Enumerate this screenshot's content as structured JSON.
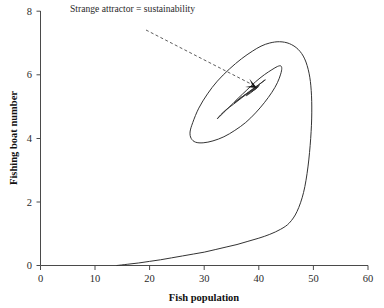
{
  "figure": {
    "background_color": "#ffffff",
    "line_color": "#333333",
    "axis_color": "#4a4a4a"
  },
  "annotation": {
    "text": "Strange attractor = sustainability",
    "leader_start": [
      146,
      30
    ],
    "leader_end": [
      255,
      86
    ],
    "arrow_target": [
      257,
      88
    ]
  },
  "chart_data": {
    "type": "line",
    "title": "",
    "subtitle": "",
    "xlabel": "Fish population",
    "ylabel": "Fishing boat number",
    "xlim": [
      0,
      60
    ],
    "ylim": [
      0,
      8
    ],
    "xticks": [
      0,
      10,
      20,
      30,
      40,
      50,
      60
    ],
    "yticks": [
      0,
      2,
      4,
      6,
      8
    ],
    "xtick_labels": [
      "0",
      "10",
      "20",
      "30",
      "40",
      "50",
      "60"
    ],
    "ytick_labels": [
      "0",
      "2",
      "4",
      "6",
      "8"
    ],
    "grid": false,
    "legend": null,
    "legend_position": "none",
    "annotations": [
      {
        "text": "Strange attractor = sustainability",
        "points_to": [
          39.5,
          5.6
        ],
        "style": "dashed-leader-with-arrow"
      }
    ],
    "series": [
      {
        "name": "Phase-space trajectory",
        "description": "Inward spiral converging on a strange attractor at about (39.5, 5.6); begins on the x-axis near fish population 14 with zero boats, sweeps right to about 49, then loops inward.",
        "x": [
          14.0,
          16.0,
          18.0,
          20.0,
          22.0,
          24.0,
          26.0,
          28.0,
          30.0,
          32.0,
          34.0,
          36.0,
          38.0,
          40.0,
          42.0,
          44.0,
          45.6,
          47.0,
          48.2,
          49.0,
          49.5,
          49.7,
          49.6,
          49.2,
          48.4,
          47.2,
          45.6,
          43.8,
          42.0,
          40.4,
          38.8,
          36.8,
          34.6,
          32.4,
          30.6,
          29.0,
          27.9,
          27.4,
          27.6,
          28.4,
          29.8,
          31.6,
          33.6,
          35.6,
          37.6,
          39.4,
          41.0,
          42.4,
          43.4,
          44.0,
          44.2,
          44.0,
          43.4,
          42.4,
          41.0,
          39.4,
          37.8,
          36.2,
          34.8,
          33.6,
          32.8,
          32.4,
          32.5,
          33.0,
          34.0,
          35.4,
          36.9,
          38.3,
          39.5,
          40.4,
          41.0,
          41.2,
          41.0,
          40.4,
          39.4,
          38.3,
          37.2,
          36.3,
          35.7,
          35.5,
          35.8,
          36.4,
          37.2,
          38.1,
          38.9,
          39.6,
          40.0,
          40.1,
          39.9,
          39.4,
          38.8,
          38.2,
          37.8,
          37.7,
          37.9,
          38.4,
          39.0,
          39.5,
          39.8,
          39.9,
          39.8,
          39.5,
          39.1,
          38.8,
          38.7,
          38.9,
          39.2,
          39.5,
          39.6,
          39.5,
          39.3,
          39.2,
          39.3,
          39.5,
          39.5
        ],
        "y": [
          0.0,
          0.04,
          0.08,
          0.13,
          0.18,
          0.24,
          0.3,
          0.36,
          0.42,
          0.5,
          0.58,
          0.66,
          0.76,
          0.86,
          0.98,
          1.14,
          1.34,
          1.7,
          2.3,
          3.1,
          4.0,
          4.8,
          5.5,
          6.05,
          6.5,
          6.8,
          6.98,
          7.04,
          7.0,
          6.9,
          6.74,
          6.5,
          6.18,
          5.8,
          5.4,
          4.95,
          4.5,
          4.2,
          4.0,
          3.88,
          3.86,
          3.92,
          4.05,
          4.25,
          4.5,
          4.8,
          5.12,
          5.45,
          5.75,
          6.02,
          6.2,
          6.28,
          6.26,
          6.16,
          6.0,
          5.78,
          5.52,
          5.26,
          5.02,
          4.82,
          4.68,
          4.62,
          4.64,
          4.74,
          4.9,
          5.08,
          5.28,
          5.46,
          5.62,
          5.74,
          5.82,
          5.84,
          5.82,
          5.74,
          5.62,
          5.48,
          5.34,
          5.22,
          5.14,
          5.12,
          5.16,
          5.24,
          5.34,
          5.44,
          5.54,
          5.62,
          5.66,
          5.67,
          5.64,
          5.58,
          5.5,
          5.42,
          5.36,
          5.34,
          5.36,
          5.42,
          5.5,
          5.57,
          5.61,
          5.62,
          5.61,
          5.57,
          5.52,
          5.48,
          5.47,
          5.49,
          5.53,
          5.57,
          5.59,
          5.58,
          5.56,
          5.55,
          5.56,
          5.58,
          5.6
        ]
      }
    ],
    "attractor_point": {
      "x": 39.5,
      "y": 5.6,
      "label": "Strange attractor = sustainability"
    }
  }
}
